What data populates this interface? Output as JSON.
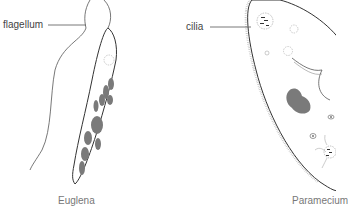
{
  "diagram": {
    "left_organism": {
      "label": "flagellum",
      "caption": "Euglena"
    },
    "right_organism": {
      "label": "cilia",
      "caption": "Paramecium"
    },
    "colors": {
      "outline": "#333333",
      "organelle": "#7a7a7a",
      "label_text": "#444444",
      "background": "#ffffff"
    }
  }
}
